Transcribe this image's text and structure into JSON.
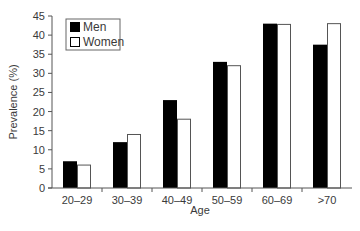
{
  "chart_data": {
    "type": "bar",
    "title": "",
    "xlabel": "Age",
    "ylabel": "Prevalence (%)",
    "categories": [
      "20–29",
      "30–39",
      "40–49",
      "50–59",
      "60–69",
      ">70"
    ],
    "series": [
      {
        "name": "Men",
        "color": "#000000",
        "values": [
          7,
          12,
          23,
          33,
          43,
          37.5
        ]
      },
      {
        "name": "Women",
        "color": "#ffffff",
        "values": [
          6,
          14,
          18,
          32,
          42.8,
          43
        ]
      }
    ],
    "ylim": [
      0,
      45
    ],
    "yticks": [
      0,
      5,
      10,
      15,
      20,
      25,
      30,
      35,
      40,
      45
    ],
    "grid": false,
    "legend_position": "upper-left"
  },
  "legend": {
    "items": [
      {
        "label": "Men",
        "color": "#000000"
      },
      {
        "label": "Women",
        "color": "#ffffff"
      }
    ]
  },
  "axes": {
    "x_title": "Age",
    "y_title": "Prevalence (%)"
  }
}
